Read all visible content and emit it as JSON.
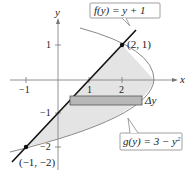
{
  "diagram": {
    "type": "region-between-curves",
    "axes": {
      "x_label": "x",
      "y_label": "y",
      "x_ticks": [
        "-1",
        "1",
        "2"
      ],
      "y_ticks": [
        "1",
        "-1",
        "-2"
      ]
    },
    "curves": [
      {
        "name": "f",
        "label": "f(y) = y + 1",
        "expression": "x = y + 1",
        "color": "#111111"
      },
      {
        "name": "g",
        "label": "g(y) = 3 − y²",
        "expression": "x = 3 - y^2",
        "color": "#888888"
      }
    ],
    "points": [
      {
        "label": "(2, 1)",
        "x": 2,
        "y": 1
      },
      {
        "label": "(−1, −2)",
        "x": -1,
        "y": -2
      }
    ],
    "rectangle": {
      "label": "Δy",
      "fill": "#b8b8b8"
    },
    "region_fill": "#e4e4e4"
  },
  "labels": {
    "f_label": "f(y) = y + 1",
    "g_prefix": "g(y) = 3 − y",
    "g_exp": "2",
    "p1": "(2, 1)",
    "p2": "(−1, −2)",
    "delta_y": "Δy",
    "x_axis": "x",
    "y_axis": "y",
    "xt_m1": "−1",
    "xt_1": "1",
    "xt_2": "2",
    "yt_1": "1",
    "yt_m1": "−1",
    "yt_m2": "−2"
  }
}
